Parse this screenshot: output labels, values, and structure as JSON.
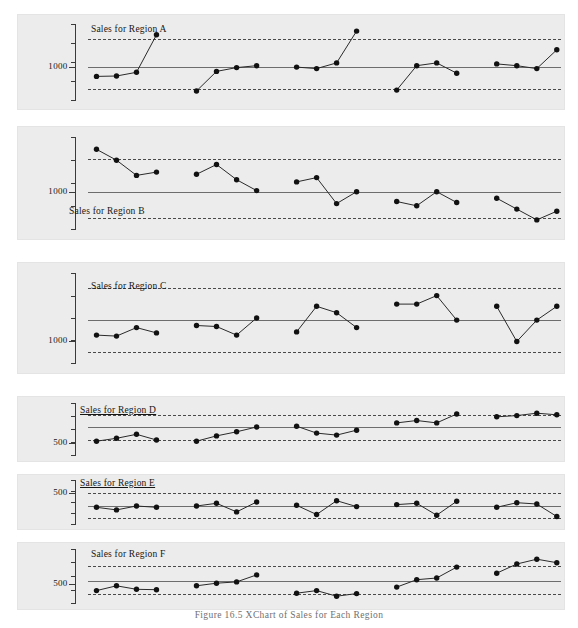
{
  "figure": {
    "caption": "Figure 16.5   XChart of Sales for Each Region",
    "colors": {
      "panel_background": "#ececec",
      "page_background": "#ffffff",
      "marker": "#111111",
      "connector": "#2a2a2a",
      "center_line": "#6d6d6d",
      "limit_line": "#4a4a4a",
      "axis": "#3a3a3a",
      "text": "#161616",
      "caption_text": "#6f6f6f"
    }
  },
  "chart_data": {
    "type": "line",
    "title": "Figure 16.5   XChart of Sales for Each Region",
    "xlabel": "",
    "ylabel": "",
    "grid": false,
    "legend": "none",
    "panels": [
      {
        "name": "Region A",
        "title": "Sales for Region A",
        "title_underlined": false,
        "tick_label": "1000",
        "tick_value": 1000,
        "ylim": [
          820,
          1230
        ],
        "center_line": 1000,
        "upper_limit": 1150,
        "lower_limit": 880,
        "x": [
          1,
          2,
          3,
          4,
          6,
          7,
          8,
          9,
          11,
          12,
          13,
          14,
          16,
          17,
          18,
          19,
          21,
          22,
          23,
          24
        ],
        "values": [
          948,
          950,
          970,
          1170,
          870,
          975,
          995,
          1005,
          998,
          990,
          1020,
          1190,
          875,
          1005,
          1020,
          965,
          1015,
          1005,
          990,
          1090
        ]
      },
      {
        "name": "Region B",
        "title": "Sales for Region B",
        "title_underlined": false,
        "tick_label": "1000",
        "tick_value": 1000,
        "ylim": [
          830,
          1250
        ],
        "center_line": 1000,
        "upper_limit": 1150,
        "lower_limit": 880,
        "x": [
          1,
          2,
          3,
          4,
          6,
          7,
          8,
          9,
          11,
          12,
          13,
          14,
          16,
          17,
          18,
          19,
          21,
          22,
          23,
          24
        ],
        "values": [
          1195,
          1145,
          1075,
          1090,
          1080,
          1125,
          1055,
          1005,
          1045,
          1065,
          945,
          1000,
          955,
          935,
          1000,
          950,
          970,
          920,
          870,
          910
        ]
      },
      {
        "name": "Region C",
        "title": "Sales for Region C",
        "title_underlined": false,
        "tick_label": "1000",
        "tick_value": 1000,
        "ylim": [
          900,
          1320
        ],
        "center_line": 1100,
        "upper_limit": 1250,
        "lower_limit": 950,
        "x": [
          1,
          2,
          3,
          4,
          6,
          7,
          8,
          9,
          11,
          12,
          13,
          14,
          16,
          17,
          18,
          19,
          21,
          22,
          23,
          24
        ],
        "values": [
          1030,
          1025,
          1065,
          1040,
          1075,
          1070,
          1030,
          1110,
          1045,
          1165,
          1135,
          1065,
          1175,
          1175,
          1215,
          1100,
          1165,
          1000,
          1100,
          1165
        ]
      },
      {
        "name": "Region D",
        "title": "Sales for Region D",
        "title_underlined": true,
        "tick_label": "500",
        "tick_value": 500,
        "ylim": [
          470,
          600
        ],
        "center_line": 540,
        "upper_limit": 570,
        "lower_limit": 508,
        "x": [
          1,
          2,
          3,
          4,
          6,
          7,
          8,
          9,
          11,
          12,
          13,
          14,
          16,
          17,
          18,
          19,
          21,
          22,
          23,
          24
        ],
        "values": [
          505,
          512,
          522,
          508,
          505,
          518,
          528,
          540,
          542,
          525,
          520,
          532,
          550,
          556,
          550,
          572,
          565,
          568,
          574,
          570
        ]
      },
      {
        "name": "Region E",
        "title": "Sales for Region E",
        "title_underlined": true,
        "tick_label": "500",
        "tick_value": 500,
        "ylim": [
          452,
          520
        ],
        "center_line": 480,
        "upper_limit": 500,
        "lower_limit": 462,
        "x": [
          1,
          2,
          3,
          4,
          6,
          7,
          8,
          9,
          11,
          12,
          13,
          14,
          16,
          17,
          18,
          19,
          21,
          22,
          23,
          24
        ],
        "values": [
          478,
          474,
          480,
          478,
          480,
          484,
          471,
          486,
          481,
          467,
          488,
          479,
          482,
          484,
          466,
          487,
          478,
          485,
          483,
          464
        ]
      },
      {
        "name": "Region F",
        "title": "Sales for Region F",
        "title_underlined": false,
        "tick_label": "500",
        "tick_value": 500,
        "ylim": [
          455,
          580
        ],
        "center_line": 505,
        "upper_limit": 540,
        "lower_limit": 475,
        "x": [
          1,
          2,
          3,
          4,
          6,
          7,
          8,
          9,
          11,
          12,
          13,
          14,
          16,
          17,
          18,
          19,
          21,
          22,
          23,
          24
        ],
        "values": [
          484,
          495,
          487,
          486,
          495,
          501,
          504,
          520,
          478,
          484,
          471,
          477,
          492,
          509,
          513,
          538,
          524,
          545,
          556,
          548
        ]
      }
    ]
  }
}
